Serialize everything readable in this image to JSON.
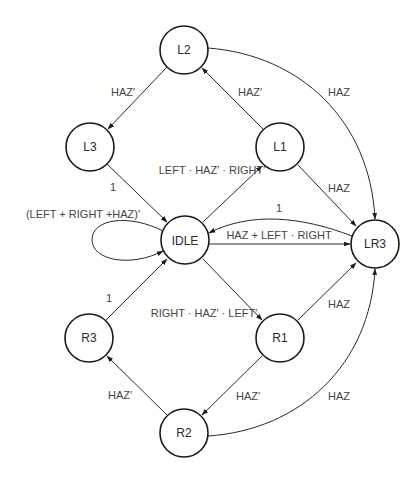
{
  "diagram": {
    "title": "",
    "type": "state-machine",
    "colors": {
      "stroke": "#1a1a1a",
      "text": "#2a2a2a",
      "label": "#444444",
      "background": "#ffffff"
    },
    "nodes": [
      {
        "id": "L2",
        "label": "L2",
        "cx": 184,
        "cy": 50
      },
      {
        "id": "L3",
        "label": "L3",
        "cx": 90,
        "cy": 147
      },
      {
        "id": "L1",
        "label": "L1",
        "cx": 280,
        "cy": 147
      },
      {
        "id": "IDLE",
        "label": "IDLE",
        "cx": 185,
        "cy": 240
      },
      {
        "id": "LR3",
        "label": "LR3",
        "cx": 375,
        "cy": 244
      },
      {
        "id": "R3",
        "label": "R3",
        "cx": 89,
        "cy": 338
      },
      {
        "id": "R1",
        "label": "R1",
        "cx": 280,
        "cy": 338
      },
      {
        "id": "R2",
        "label": "R2",
        "cx": 184,
        "cy": 433
      }
    ],
    "edges": [
      {
        "from": "L2",
        "to": "L3",
        "label": "HAZ′"
      },
      {
        "from": "L1",
        "to": "L2",
        "label": "HAZ′"
      },
      {
        "from": "L2",
        "to": "LR3",
        "label": "HAZ"
      },
      {
        "from": "L3",
        "to": "IDLE",
        "label": "1"
      },
      {
        "from": "IDLE",
        "to": "L1",
        "label": "LEFT · HAZ′ · RIGHT′"
      },
      {
        "from": "L1",
        "to": "LR3",
        "label": "HAZ"
      },
      {
        "from": "LR3",
        "to": "IDLE",
        "label": "1"
      },
      {
        "from": "IDLE",
        "to": "LR3",
        "label": "HAZ + LEFT · RIGHT"
      },
      {
        "from": "IDLE",
        "to": "IDLE",
        "label": "(LEFT + RIGHT +HAZ)′"
      },
      {
        "from": "R3",
        "to": "IDLE",
        "label": "1"
      },
      {
        "from": "IDLE",
        "to": "R1",
        "label": "RIGHT · HAZ′ · LEFT′"
      },
      {
        "from": "R1",
        "to": "LR3",
        "label": "HAZ"
      },
      {
        "from": "R1",
        "to": "R2",
        "label": "HAZ′"
      },
      {
        "from": "R2",
        "to": "R3",
        "label": "HAZ′"
      },
      {
        "from": "R2",
        "to": "LR3",
        "label": "HAZ"
      }
    ]
  }
}
